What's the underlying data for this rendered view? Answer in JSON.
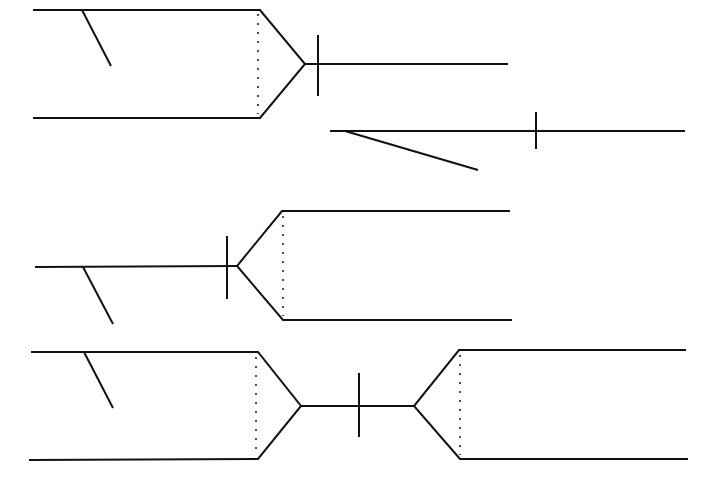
{
  "diagram": {
    "width": 706,
    "height": 478,
    "stroke_color": "#111111",
    "background": "#ffffff",
    "figures": [
      {
        "name": "figure-1-split-right",
        "solid": [
          [
            [
              33,
              10
            ],
            [
              260,
              10
            ],
            [
              305,
              64
            ],
            [
              260,
              118
            ],
            [
              33,
              118
            ]
          ],
          [
            [
              305,
              64
            ],
            [
              508,
              64
            ]
          ],
          [
            [
              318,
              35
            ],
            [
              318,
              96
            ]
          ],
          [
            [
              82,
              10
            ],
            [
              111,
              66
            ]
          ]
        ],
        "dotted": [
          [
            [
              258,
              14
            ],
            [
              258,
              114
            ]
          ]
        ]
      },
      {
        "name": "figure-2-line-with-branch",
        "solid": [
          [
            [
              330,
              131
            ],
            [
              685,
              131
            ]
          ],
          [
            [
              536,
              112
            ],
            [
              536,
              149
            ]
          ],
          [
            [
              345,
              131
            ],
            [
              478,
              170
            ]
          ]
        ],
        "dotted": []
      },
      {
        "name": "figure-3-split-left",
        "solid": [
          [
            [
              35,
              267
            ],
            [
              237,
              266
            ]
          ],
          [
            [
              510,
              211
            ],
            [
              282,
              211
            ],
            [
              237,
              266
            ],
            [
              283,
              320
            ],
            [
              512,
              320
            ]
          ],
          [
            [
              227,
              236
            ],
            [
              227,
              299
            ]
          ],
          [
            [
              83,
              267
            ],
            [
              113,
              324
            ]
          ]
        ],
        "dotted": [
          [
            [
              283,
              216
            ],
            [
              283,
              316
            ]
          ]
        ]
      },
      {
        "name": "figure-4-double-split",
        "solid": [
          [
            [
              31,
              352
            ],
            [
              258,
              352
            ],
            [
              301,
              406
            ],
            [
              258,
              459
            ],
            [
              29,
              460
            ]
          ],
          [
            [
              301,
              406
            ],
            [
              414,
              406
            ]
          ],
          [
            [
              686,
              350
            ],
            [
              459,
              350
            ],
            [
              414,
              406
            ],
            [
              460,
              459
            ],
            [
              688,
              459
            ]
          ],
          [
            [
              359,
              373
            ],
            [
              359,
              437
            ]
          ],
          [
            [
              84,
              352
            ],
            [
              113,
              408
            ]
          ]
        ],
        "dotted": [
          [
            [
              256,
              357
            ],
            [
              256,
              455
            ]
          ],
          [
            [
              460,
              355
            ],
            [
              460,
              455
            ]
          ]
        ]
      }
    ]
  }
}
